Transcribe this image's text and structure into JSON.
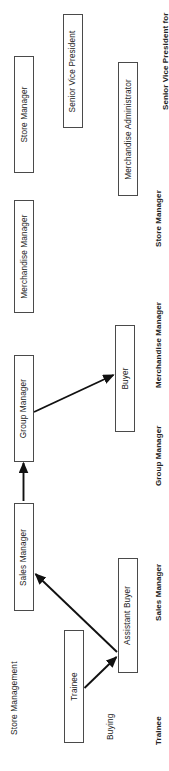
{
  "diagram": {
    "orientation": "rotated-90",
    "line_color": "#111111",
    "box_border_color": "#4a4a4a",
    "background": "#ffffff"
  },
  "nodes": [
    {
      "id": "store-manager",
      "label": "Store Manager"
    },
    {
      "id": "senior-vice-president",
      "label": "Senior Vice President"
    },
    {
      "id": "merchandise-administrator",
      "label": "Merchandise Administrator"
    },
    {
      "id": "merchandise-manager",
      "label": "Merchandise Manager"
    },
    {
      "id": "group-manager",
      "label": "Group Manager"
    },
    {
      "id": "buyer",
      "label": "Buyer"
    },
    {
      "id": "sales-manager",
      "label": "Sales Manager"
    },
    {
      "id": "assistant-buyer",
      "label": "Assistant Buyer"
    },
    {
      "id": "trainee",
      "label": "Trainee"
    }
  ],
  "category_labels": [
    {
      "id": "store-management",
      "label": "Store Management"
    },
    {
      "id": "buying",
      "label": "Buying"
    }
  ],
  "level_labels": [
    {
      "id": "senior-vice-president-for",
      "label": "Senior Vice President for"
    },
    {
      "id": "store-manager-level",
      "label": "Store Manager"
    },
    {
      "id": "merchandise-manager-level",
      "label": "Merchandise Manager"
    },
    {
      "id": "group-manager-level",
      "label": "Group Manager"
    },
    {
      "id": "sales-manager-level",
      "label": "Sales Manager"
    },
    {
      "id": "trainee-level",
      "label": "Trainee"
    }
  ],
  "connections": [
    {
      "from": "trainee",
      "to": "assistant-buyer"
    },
    {
      "from": "assistant-buyer",
      "to": "sales-manager"
    },
    {
      "from": "sales-manager",
      "to": "group-manager"
    },
    {
      "from": "group-manager",
      "to": "buyer"
    }
  ]
}
